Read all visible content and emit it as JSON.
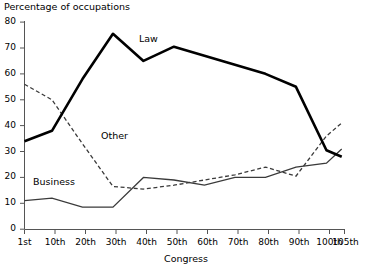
{
  "chart_data": {
    "type": "line",
    "title": "",
    "ylabel": "Percentage of occupations",
    "xlabel": "Congress",
    "categories": [
      "1st",
      "10th",
      "20th",
      "30th",
      "40th",
      "50th",
      "60th",
      "70th",
      "80th",
      "90th",
      "100th",
      "105th"
    ],
    "x": [
      1,
      10,
      20,
      30,
      40,
      50,
      60,
      70,
      80,
      90,
      100,
      105
    ],
    "xlim": [
      1,
      105
    ],
    "ylim": [
      0,
      80
    ],
    "yticks": [
      0,
      10,
      20,
      30,
      40,
      50,
      60,
      70,
      80
    ],
    "grid": false,
    "legend": "inline-annotations",
    "series": [
      {
        "name": "Law",
        "style": "solid-thick",
        "color": "#000000",
        "values": [
          34,
          38,
          58,
          75.5,
          65,
          70.5,
          67,
          63.5,
          60,
          55,
          30.5,
          28
        ]
      },
      {
        "name": "Other",
        "style": "dashed",
        "color": "#3a3a3a",
        "values": [
          56,
          50,
          33,
          16.5,
          15.5,
          17,
          19,
          21,
          24,
          20.5,
          36,
          41
        ]
      },
      {
        "name": "Business",
        "style": "solid-thin",
        "color": "#3a3a3a",
        "values": [
          11,
          12,
          8.5,
          8.5,
          20,
          19,
          17,
          20,
          20,
          24,
          25.5,
          31
        ]
      }
    ],
    "annotations": [
      {
        "text": "Law",
        "x": 40,
        "y": 72
      },
      {
        "text": "Other",
        "x": 26,
        "y": 37
      },
      {
        "text": "Business",
        "x": 5,
        "y": 20
      }
    ]
  },
  "axis": {
    "y_title": "Percentage of occupations",
    "x_title": "Congress",
    "y_tick_labels": [
      "80",
      "70",
      "60",
      "50",
      "40",
      "30",
      "20",
      "10",
      "0"
    ],
    "x_tick_labels": [
      "1st",
      "10th",
      "20th",
      "30th",
      "40th",
      "50th",
      "60th",
      "70th",
      "80th",
      "90th",
      "100th",
      "105th"
    ]
  },
  "series_labels": {
    "law": "Law",
    "other": "Other",
    "business": "Business"
  }
}
